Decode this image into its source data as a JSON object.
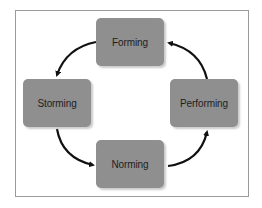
{
  "diagram": {
    "type": "cycle",
    "stages": [
      {
        "id": "forming",
        "label": "Forming"
      },
      {
        "id": "storming",
        "label": "Storming"
      },
      {
        "id": "norming",
        "label": "Norming"
      },
      {
        "id": "performing",
        "label": "Performing"
      }
    ],
    "edges": [
      {
        "from": "forming",
        "to": "storming"
      },
      {
        "from": "storming",
        "to": "norming"
      },
      {
        "from": "norming",
        "to": "performing"
      },
      {
        "from": "performing",
        "to": "forming"
      }
    ],
    "colors": {
      "box_fill": "#8f8f8f",
      "text": "#1e1e1e",
      "arrow": "#111111",
      "frame_border": "#9a9a9a"
    }
  }
}
